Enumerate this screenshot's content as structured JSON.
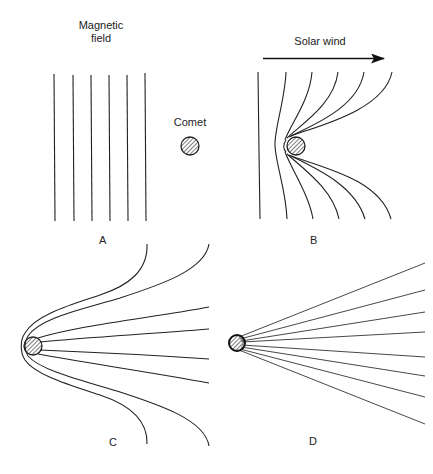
{
  "diagram": {
    "labels": {
      "magnetic_field": "Magnetic\nfield",
      "magnetic_field_line1": "Magnetic",
      "magnetic_field_line2": "field",
      "comet": "Comet",
      "solar_wind": "Solar wind"
    },
    "panels": [
      {
        "id": "A",
        "label": "A",
        "description": "Straight vertical magnetic field lines approaching a comet"
      },
      {
        "id": "B",
        "label": "B",
        "description": "Field lines draping around the comet in the solar wind flow"
      },
      {
        "id": "C",
        "label": "C",
        "description": "Field lines wrapped around the comet and stretched downstream"
      },
      {
        "id": "D",
        "label": "D",
        "description": "Field lines forming a straight tail fanning out from the comet"
      }
    ],
    "colors": {
      "line": "#222222",
      "background": "#ffffff"
    }
  }
}
